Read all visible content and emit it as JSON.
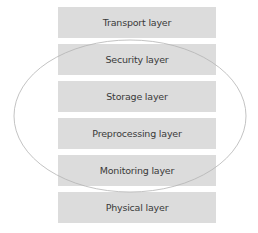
{
  "diagram": {
    "layers": [
      {
        "label": "Transport layer"
      },
      {
        "label": "Security layer"
      },
      {
        "label": "Storage layer"
      },
      {
        "label": "Preprocessing layer"
      },
      {
        "label": "Monitoring layer"
      },
      {
        "label": "Physical layer"
      }
    ],
    "colors": {
      "box_fill": "#dcdcdc",
      "text": "#3a3a3a",
      "ellipse_stroke": "#b4b4b4"
    }
  }
}
